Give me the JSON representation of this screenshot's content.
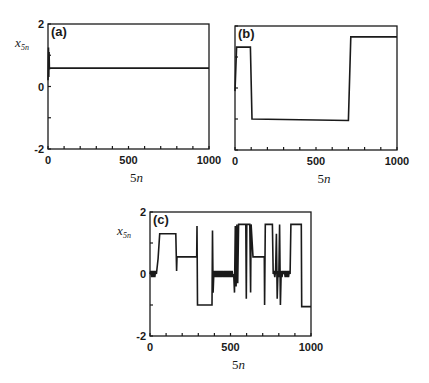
{
  "figure": {
    "background": "#ffffff",
    "ink_color": "#1a1a1a"
  },
  "chart_data": [
    {
      "id": "a",
      "type": "line",
      "panel_label": "(a)",
      "title": "",
      "xlabel": "5n",
      "ylabel": "x_5n",
      "xlim": [
        0,
        1000
      ],
      "ylim": [
        -2,
        2
      ],
      "xticks": [
        0,
        500,
        1000
      ],
      "yticks": [
        -2,
        0,
        2
      ],
      "grid": false,
      "legend": null,
      "frame": {
        "left": 48,
        "right": 209,
        "top": 24,
        "bottom": 149
      },
      "series": [
        {
          "name": "x_5n",
          "x": [
            0,
            3,
            5,
            7,
            9,
            12,
            1000
          ],
          "y": [
            0.2,
            1.25,
            0.3,
            1.1,
            0.55,
            0.59,
            0.59
          ]
        }
      ]
    },
    {
      "id": "b",
      "type": "line",
      "panel_label": "(b)",
      "title": "",
      "xlabel": "5n",
      "ylabel": "",
      "xlim": [
        0,
        1000
      ],
      "ylim": [
        -2,
        2
      ],
      "xticks": [
        0,
        500,
        1000
      ],
      "yticks": [],
      "grid": false,
      "legend": null,
      "frame": {
        "left": 235,
        "right": 397,
        "top": 26,
        "bottom": 150
      },
      "series": [
        {
          "name": "x_5n",
          "x": [
            0,
            10,
            95,
            105,
            700,
            715,
            1000
          ],
          "y": [
            -0.1,
            1.32,
            1.32,
            -1.0,
            -1.05,
            1.65,
            1.65
          ]
        }
      ]
    },
    {
      "id": "c",
      "type": "line",
      "panel_label": "(c)",
      "title": "",
      "xlabel": "5n",
      "ylabel": "x_5n",
      "xlim": [
        0,
        1000
      ],
      "ylim": [
        -2,
        2
      ],
      "xticks": [
        0,
        500,
        1000
      ],
      "yticks": [
        -2,
        0,
        2
      ],
      "grid": false,
      "legend": null,
      "frame": {
        "left": 150,
        "right": 311,
        "top": 212,
        "bottom": 336
      },
      "series": [
        {
          "name": "x_5n",
          "x": [
            0,
            5,
            10,
            15,
            20,
            25,
            30,
            35,
            40,
            50,
            60,
            160,
            165,
            168,
            172,
            290,
            292,
            295,
            300,
            385,
            388,
            392,
            396,
            400,
            405,
            410,
            415,
            420,
            425,
            430,
            435,
            440,
            445,
            450,
            455,
            460,
            465,
            470,
            475,
            480,
            485,
            490,
            495,
            500,
            505,
            510,
            515,
            520,
            525,
            530,
            535,
            540,
            545,
            550,
            560,
            595,
            598,
            601,
            604,
            620,
            625,
            628,
            640,
            710,
            712,
            716,
            720,
            725,
            760,
            765,
            770,
            775,
            780,
            785,
            790,
            795,
            800,
            805,
            810,
            815,
            820,
            825,
            830,
            835,
            840,
            845,
            850,
            855,
            860,
            865,
            870,
            875,
            880,
            940,
            942,
            1000
          ],
          "y": [
            0.0,
            0.1,
            -0.1,
            0.1,
            -0.1,
            0.1,
            -0.1,
            0.1,
            0.0,
            0.5,
            1.3,
            1.3,
            0.1,
            0.55,
            0.55,
            0.55,
            1.55,
            -1.0,
            -1.0,
            -1.0,
            1.4,
            -0.6,
            0.0,
            0.1,
            -0.1,
            0.1,
            -0.1,
            0.1,
            -0.1,
            0.1,
            -0.1,
            0.1,
            -0.1,
            0.1,
            -0.1,
            0.1,
            -0.1,
            0.1,
            -0.1,
            0.1,
            -0.1,
            0.1,
            -0.1,
            0.1,
            -0.1,
            0.1,
            -0.1,
            0.0,
            -0.6,
            1.55,
            -0.4,
            1.6,
            -0.3,
            1.6,
            1.6,
            1.6,
            -0.8,
            1.6,
            1.6,
            1.6,
            -0.6,
            1.6,
            0.55,
            0.55,
            -1.0,
            1.6,
            1.6,
            1.6,
            1.6,
            0.0,
            0.1,
            -0.1,
            0.1,
            1.3,
            -0.8,
            0.1,
            -0.1,
            1.6,
            -1.0,
            0.1,
            -0.1,
            0.1,
            0.0,
            0.1,
            -0.1,
            0.1,
            -0.1,
            0.1,
            -0.1,
            0.1,
            0.0,
            1.6,
            1.6,
            1.6,
            -1.05,
            -1.05
          ]
        }
      ]
    }
  ]
}
